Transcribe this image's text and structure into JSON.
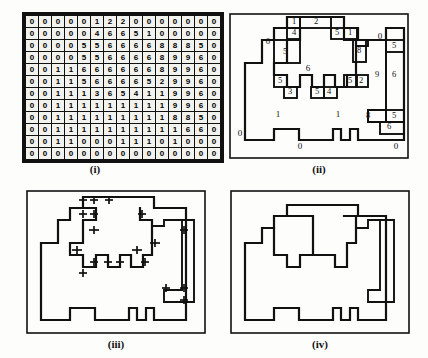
{
  "figure": {
    "panels": [
      {
        "id": "i",
        "caption": "(i)",
        "description": "label value grid"
      },
      {
        "id": "ii",
        "caption": "(ii)",
        "description": "region boundaries with chain-code labels"
      },
      {
        "id": "iii",
        "caption": "(iii)",
        "description": "boundary with crossing markers"
      },
      {
        "id": "iv",
        "caption": "(iv)",
        "description": "simplified boundary polygon"
      }
    ]
  },
  "chart_data": {
    "type": "heatmap",
    "xlabel": "",
    "ylabel": "",
    "rows": 12,
    "cols": 15,
    "values": [
      [
        0,
        0,
        0,
        0,
        0,
        1,
        2,
        2,
        0,
        0,
        0,
        0,
        0,
        0,
        0
      ],
      [
        0,
        0,
        0,
        0,
        0,
        4,
        6,
        6,
        5,
        1,
        0,
        0,
        0,
        0,
        0
      ],
      [
        0,
        0,
        0,
        0,
        5,
        5,
        6,
        6,
        6,
        6,
        8,
        8,
        8,
        5,
        0
      ],
      [
        0,
        0,
        0,
        0,
        5,
        5,
        6,
        6,
        6,
        6,
        8,
        9,
        9,
        6,
        0
      ],
      [
        0,
        0,
        1,
        1,
        6,
        6,
        6,
        6,
        6,
        6,
        8,
        9,
        9,
        6,
        0
      ],
      [
        0,
        0,
        1,
        1,
        5,
        6,
        6,
        6,
        6,
        5,
        2,
        9,
        9,
        6,
        0
      ],
      [
        0,
        0,
        1,
        1,
        1,
        3,
        6,
        5,
        4,
        1,
        1,
        9,
        9,
        6,
        0
      ],
      [
        0,
        0,
        1,
        1,
        1,
        1,
        1,
        1,
        1,
        1,
        1,
        9,
        9,
        6,
        0
      ],
      [
        0,
        0,
        1,
        1,
        1,
        1,
        1,
        1,
        1,
        1,
        1,
        8,
        8,
        5,
        0
      ],
      [
        0,
        0,
        1,
        1,
        1,
        1,
        1,
        1,
        1,
        1,
        1,
        1,
        6,
        6,
        0
      ],
      [
        0,
        0,
        1,
        1,
        0,
        0,
        0,
        1,
        1,
        1,
        0,
        1,
        0,
        0,
        0
      ],
      [
        0,
        0,
        0,
        0,
        0,
        0,
        0,
        0,
        0,
        0,
        0,
        0,
        0,
        0,
        0
      ]
    ],
    "legend": []
  },
  "panel_ii": {
    "caption": "(ii)",
    "outer_labels": [
      {
        "text": "0",
        "x": 40,
        "y": 30
      },
      {
        "text": "0",
        "x": 152,
        "y": 25
      },
      {
        "text": "0",
        "x": 12,
        "y": 122
      },
      {
        "text": "0",
        "x": 72,
        "y": 135
      },
      {
        "text": "0",
        "x": 168,
        "y": 135
      }
    ],
    "region_labels": [
      {
        "text": "6",
        "x": 80,
        "y": 57
      },
      {
        "text": "1",
        "x": 50,
        "y": 103
      },
      {
        "text": "1",
        "x": 110,
        "y": 103
      }
    ],
    "boxed_labels": [
      {
        "text": "1",
        "x": 66,
        "y": 10
      },
      {
        "text": "2",
        "x": 88,
        "y": 10
      },
      {
        "text": "4",
        "x": 66,
        "y": 21
      },
      {
        "text": "5",
        "x": 109,
        "y": 21
      },
      {
        "text": "1",
        "x": 122,
        "y": 21
      },
      {
        "text": "5",
        "x": 57,
        "y": 40
      },
      {
        "text": "8",
        "x": 131,
        "y": 39
      },
      {
        "text": "5",
        "x": 166,
        "y": 34
      },
      {
        "text": "9",
        "x": 149,
        "y": 63
      },
      {
        "text": "6",
        "x": 166,
        "y": 63
      },
      {
        "text": "5",
        "x": 52,
        "y": 69
      },
      {
        "text": "5",
        "x": 122,
        "y": 69
      },
      {
        "text": "2",
        "x": 133,
        "y": 69
      },
      {
        "text": "3",
        "x": 62,
        "y": 80
      },
      {
        "text": "5",
        "x": 89,
        "y": 80
      },
      {
        "text": "4",
        "x": 101,
        "y": 80
      },
      {
        "text": "8",
        "x": 140,
        "y": 104
      },
      {
        "text": "5",
        "x": 166,
        "y": 104
      },
      {
        "text": "6",
        "x": 161,
        "y": 115
      }
    ]
  },
  "panel_iii": {
    "caption": "(iii)",
    "marker_count": 22
  },
  "panel_iv": {
    "caption": "(iv)"
  }
}
